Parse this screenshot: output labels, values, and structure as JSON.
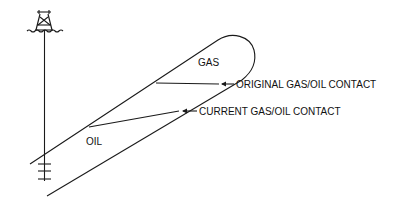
{
  "diagram": {
    "labels": {
      "gas": "GAS",
      "oil": "OIL",
      "original_contact": "ORIGINAL GAS/OIL CONTACT",
      "current_contact": "CURRENT GAS/OIL CONTACT"
    },
    "elements": [
      "offshore-rig",
      "water-surface",
      "wellbore",
      "perforations",
      "tilted-reservoir",
      "original-gas-oil-contact",
      "current-gas-oil-contact"
    ],
    "colors": {
      "line": "#1a1a1a",
      "background": "#ffffff"
    }
  }
}
